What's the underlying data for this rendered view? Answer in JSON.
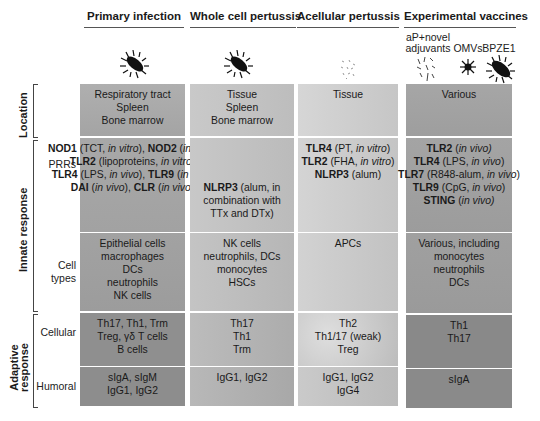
{
  "columns": [
    {
      "id": "primary",
      "title": "Primary infection",
      "icon": "bacterium-icon"
    },
    {
      "id": "wcp",
      "title": "Whole cell pertussis",
      "icon": "bacterium-icon"
    },
    {
      "id": "acp",
      "title": "Acellular pertussis",
      "icon": "antigen-fragments-icon"
    },
    {
      "id": "exp",
      "title": "Experimental vaccines",
      "sublabels": [
        {
          "label": "aP+novel\nadjuvants",
          "icon": "antigen-fragments-icon"
        },
        {
          "label": "OMVs",
          "icon": "vesicle-icon"
        },
        {
          "label": "BPZE1",
          "icon": "bacterium-icon"
        }
      ]
    }
  ],
  "row_groups": [
    {
      "label": "Location",
      "rows": [
        "location"
      ]
    },
    {
      "label": "Innate response",
      "rows": [
        "prrs",
        "cell_types"
      ]
    },
    {
      "label": "Adaptive\nresponse",
      "rows": [
        "cellular",
        "humoral"
      ]
    }
  ],
  "row_labels": {
    "location": "",
    "prrs": "PRRs",
    "cell_types": "Cell\ntypes",
    "cellular": "Cellular",
    "humoral": "Humoral"
  },
  "cells": {
    "primary": {
      "location": "Respiratory tract\nSpleen\nBone marrow",
      "prrs": "NOD1 (TCT, in vitro), NOD2 (in vitro) | TLR2 (lipoproteins, in vitro) | TLR4 (LPS, in vivo), TLR9 (in vivo) | DAI (in vivo), CLR (in vivo)",
      "cell_types": "Epithelial cells\nmacrophages\nDCs\nneutrophils\nNK cells",
      "cellular": "Th17, Th1, Trm\nTreg, γδ T cells\nB cells",
      "humoral": "sIgA, sIgM\nIgG1, IgG2"
    },
    "wcp": {
      "location": "Tissue\nSpleen\nBone marrow",
      "prrs": "NLRP3 (alum, in combination with TTx and DTx)",
      "cell_types": "NK cells\nneutrophils, DCs\nmonocytes\nHSCs",
      "cellular": "Th17\nTh1\nTrm",
      "humoral": "IgG1, IgG2"
    },
    "acp": {
      "location": "Tissue",
      "prrs": "TLR4 (PT, in vitro) | TLR2 (FHA, in vitro) | NLRP3 (alum)",
      "cell_types": "APCs",
      "cellular": "Th2\nTh1/17 (weak)\nTreg",
      "humoral": "IgG1, IgG2\nIgG4"
    },
    "exp": {
      "location": "Various",
      "prrs": "TLR2 (in vivo) | TLR4 (LPS, in vivo) | TLR7 (R848-alum, in vivo) | TLR9 (CpG, in vivo) | STING (in vivo)",
      "cell_types": "Various, including\nmonocytes\nneutrophils\nDCs",
      "cellular": "Th1\nTh17",
      "humoral": "sIgA"
    }
  },
  "prr_parts": {
    "primary": [
      [
        [
          "b",
          "NOD1"
        ],
        [
          "t",
          " (TCT, "
        ],
        [
          "i",
          "in vitro"
        ],
        [
          "t",
          "), "
        ],
        [
          "b",
          "NOD2"
        ],
        [
          "t",
          " ("
        ],
        [
          "i",
          "in vitro"
        ],
        [
          "t",
          ")"
        ]
      ],
      [
        [
          "b",
          "TLR2"
        ],
        [
          "t",
          " (lipoproteins, "
        ],
        [
          "i",
          "in vitro"
        ],
        [
          "t",
          ")"
        ]
      ],
      [
        [
          "b",
          "TLR4"
        ],
        [
          "t",
          " (LPS, "
        ],
        [
          "i",
          "in vivo"
        ],
        [
          "t",
          "), "
        ],
        [
          "b",
          "TLR9"
        ],
        [
          "t",
          " ("
        ],
        [
          "i",
          "in vivo"
        ],
        [
          "t",
          ")"
        ]
      ],
      [
        [
          "b",
          "DAI"
        ],
        [
          "t",
          " ("
        ],
        [
          "i",
          "in vivo"
        ],
        [
          "t",
          "), "
        ],
        [
          "b",
          "CLR"
        ],
        [
          "t",
          " ("
        ],
        [
          "i",
          "in vivo"
        ],
        [
          "t",
          ")"
        ]
      ]
    ],
    "wcp": [
      [
        [
          "b",
          "NLRP3"
        ],
        [
          "t",
          " (alum, in"
        ]
      ],
      [
        [
          "t",
          "combination with"
        ]
      ],
      [
        [
          "t",
          "TTx and DTx)"
        ]
      ]
    ],
    "acp": [
      [
        [
          "b",
          "TLR4"
        ],
        [
          "t",
          " (PT, "
        ],
        [
          "i",
          "in vitro"
        ],
        [
          "t",
          ")"
        ]
      ],
      [
        [
          "b",
          "TLR2"
        ],
        [
          "t",
          " (FHA, "
        ],
        [
          "i",
          "in vitro"
        ],
        [
          "t",
          ")"
        ]
      ],
      [
        [
          "b",
          "NLRP3"
        ],
        [
          "t",
          " (alum)"
        ]
      ]
    ],
    "exp": [
      [
        [
          "b",
          "TLR2"
        ],
        [
          "t",
          " ("
        ],
        [
          "i",
          "in vivo)"
        ]
      ],
      [
        [
          "b",
          "TLR4"
        ],
        [
          "t",
          " (LPS, "
        ],
        [
          "i",
          "in vivo"
        ],
        [
          "t",
          ")"
        ]
      ],
      [
        [
          "b",
          "TLR7"
        ],
        [
          "t",
          " (R848-alum, "
        ],
        [
          "i",
          "in vivo"
        ],
        [
          "t",
          ")"
        ]
      ],
      [
        [
          "b",
          "TLR9"
        ],
        [
          "t",
          " (CpG, "
        ],
        [
          "i",
          "in vivo"
        ],
        [
          "t",
          ")"
        ]
      ],
      [
        [
          "b",
          "STING"
        ],
        [
          "t",
          " ("
        ],
        [
          "i",
          "in vivo)"
        ]
      ]
    ]
  },
  "colors": {
    "location_primary": "#a9a9a9",
    "location_wcp": "#c4c4c4",
    "location_acp": "#cfcfcf",
    "location_exp": "#a2a2a2",
    "innate_primary": "#a6a6a6",
    "innate_wcp": "#c2c2c2",
    "innate_acp": "#cdcdcd",
    "innate_exp": "#a0a0a0",
    "adaptive_primary": "#8e8e8e",
    "adaptive_wcp": "#b4b4b4",
    "adaptive_acp": "#c4c4c4",
    "adaptive_exp": "#8a8a8a"
  }
}
